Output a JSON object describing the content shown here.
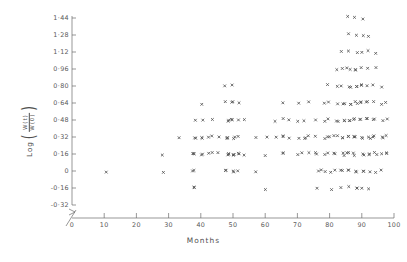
{
  "chart_data": {
    "type": "scatter",
    "title": "",
    "xlabel": "Months",
    "ylabel": "Log (W(t)/W(0))",
    "ylabel_parts": {
      "prefix": "Log",
      "numerator": "W(t)",
      "denominator": "W(0)"
    },
    "xlim": [
      0,
      100
    ],
    "ylim": [
      -0.32,
      1.44
    ],
    "xticks": [
      0,
      10,
      20,
      30,
      40,
      50,
      60,
      70,
      80,
      90,
      100
    ],
    "xtick_labels": [
      "0",
      "10",
      "20",
      "30",
      "40",
      "50",
      "60",
      "70",
      "80",
      "90",
      "100"
    ],
    "yticks": [
      1.44,
      1.28,
      1.12,
      0.96,
      0.8,
      0.64,
      0.48,
      0.32,
      0.16,
      0,
      -0.16,
      -0.32
    ],
    "ytick_labels": [
      "1·44",
      "1·28",
      "1·12",
      "0·96",
      "0·80",
      "0·64",
      "0·48",
      "0·32",
      "0·16",
      "0",
      "-0·16",
      "-0·32"
    ],
    "grid": false,
    "legend": false,
    "marker": "x",
    "marker_color": "#555555",
    "axis_break_x": true,
    "axis_break_y": true,
    "points": [
      [
        10,
        0.0
      ],
      [
        28,
        0.16
      ],
      [
        28,
        0.0
      ],
      [
        33,
        0.32
      ],
      [
        38,
        0.48
      ],
      [
        38,
        0.32
      ],
      [
        38,
        0.32
      ],
      [
        38,
        0.16
      ],
      [
        38,
        0.16
      ],
      [
        38,
        0.16
      ],
      [
        38,
        0.0
      ],
      [
        38,
        0.0
      ],
      [
        38,
        -0.16
      ],
      [
        38,
        -0.16
      ],
      [
        40,
        0.64
      ],
      [
        40,
        0.48
      ],
      [
        40,
        0.32
      ],
      [
        40,
        0.32
      ],
      [
        40,
        0.16
      ],
      [
        40,
        0.16
      ],
      [
        42,
        0.32
      ],
      [
        42,
        0.16
      ],
      [
        44,
        0.48
      ],
      [
        44,
        0.32
      ],
      [
        44,
        0.16
      ],
      [
        46,
        0.32
      ],
      [
        46,
        0.16
      ],
      [
        48,
        0.8
      ],
      [
        48,
        0.64
      ],
      [
        48,
        0.48
      ],
      [
        48,
        0.48
      ],
      [
        48,
        0.32
      ],
      [
        48,
        0.32
      ],
      [
        48,
        0.32
      ],
      [
        48,
        0.16
      ],
      [
        48,
        0.16
      ],
      [
        48,
        0.16
      ],
      [
        48,
        0.0
      ],
      [
        48,
        0.0
      ],
      [
        50,
        0.8
      ],
      [
        50,
        0.64
      ],
      [
        50,
        0.64
      ],
      [
        50,
        0.48
      ],
      [
        50,
        0.48
      ],
      [
        50,
        0.32
      ],
      [
        50,
        0.32
      ],
      [
        50,
        0.16
      ],
      [
        50,
        0.16
      ],
      [
        50,
        0.16
      ],
      [
        50,
        0.0
      ],
      [
        50,
        0.0
      ],
      [
        52,
        0.64
      ],
      [
        52,
        0.48
      ],
      [
        52,
        0.32
      ],
      [
        52,
        0.16
      ],
      [
        52,
        0.16
      ],
      [
        52,
        0.0
      ],
      [
        54,
        0.48
      ],
      [
        54,
        0.16
      ],
      [
        57,
        0.32
      ],
      [
        57,
        0.0
      ],
      [
        60,
        0.32
      ],
      [
        60,
        0.16
      ],
      [
        60,
        -0.16
      ],
      [
        63,
        0.48
      ],
      [
        63,
        0.32
      ],
      [
        66,
        0.64
      ],
      [
        66,
        0.48
      ],
      [
        66,
        0.32
      ],
      [
        66,
        0.32
      ],
      [
        66,
        0.16
      ],
      [
        66,
        0.16
      ],
      [
        68,
        0.48
      ],
      [
        68,
        0.32
      ],
      [
        70,
        0.64
      ],
      [
        70,
        0.48
      ],
      [
        70,
        0.32
      ],
      [
        70,
        0.16
      ],
      [
        72,
        0.48
      ],
      [
        72,
        0.32
      ],
      [
        72,
        0.32
      ],
      [
        72,
        0.16
      ],
      [
        74,
        0.64
      ],
      [
        74,
        0.32
      ],
      [
        74,
        0.16
      ],
      [
        76,
        0.48
      ],
      [
        76,
        0.32
      ],
      [
        76,
        0.16
      ],
      [
        76,
        0.16
      ],
      [
        76,
        0.0
      ],
      [
        76,
        -0.16
      ],
      [
        78,
        0.64
      ],
      [
        78,
        0.48
      ],
      [
        78,
        0.32
      ],
      [
        78,
        0.16
      ],
      [
        78,
        0.0
      ],
      [
        78,
        0.0
      ],
      [
        80,
        0.8
      ],
      [
        80,
        0.64
      ],
      [
        80,
        0.48
      ],
      [
        80,
        0.32
      ],
      [
        80,
        0.32
      ],
      [
        80,
        0.16
      ],
      [
        80,
        0.0
      ],
      [
        80,
        -0.16
      ],
      [
        82,
        0.96
      ],
      [
        82,
        0.8
      ],
      [
        82,
        0.64
      ],
      [
        82,
        0.48
      ],
      [
        82,
        0.48
      ],
      [
        82,
        0.32
      ],
      [
        82,
        0.32
      ],
      [
        82,
        0.16
      ],
      [
        82,
        0.16
      ],
      [
        82,
        0.0
      ],
      [
        84,
        1.12
      ],
      [
        84,
        0.96
      ],
      [
        84,
        0.8
      ],
      [
        84,
        0.64
      ],
      [
        84,
        0.64
      ],
      [
        84,
        0.48
      ],
      [
        84,
        0.48
      ],
      [
        84,
        0.32
      ],
      [
        84,
        0.32
      ],
      [
        84,
        0.16
      ],
      [
        84,
        0.16
      ],
      [
        84,
        0.0
      ],
      [
        84,
        0.0
      ],
      [
        84,
        -0.16
      ],
      [
        86,
        1.44
      ],
      [
        86,
        1.28
      ],
      [
        86,
        1.12
      ],
      [
        86,
        0.96
      ],
      [
        86,
        0.96
      ],
      [
        86,
        0.8
      ],
      [
        86,
        0.8
      ],
      [
        86,
        0.64
      ],
      [
        86,
        0.64
      ],
      [
        86,
        0.48
      ],
      [
        86,
        0.48
      ],
      [
        86,
        0.32
      ],
      [
        86,
        0.32
      ],
      [
        86,
        0.16
      ],
      [
        86,
        0.16
      ],
      [
        86,
        0.0
      ],
      [
        86,
        0.0
      ],
      [
        86,
        -0.16
      ],
      [
        88,
        1.44
      ],
      [
        88,
        1.28
      ],
      [
        88,
        1.12
      ],
      [
        88,
        0.96
      ],
      [
        88,
        0.96
      ],
      [
        88,
        0.8
      ],
      [
        88,
        0.8
      ],
      [
        88,
        0.64
      ],
      [
        88,
        0.64
      ],
      [
        88,
        0.48
      ],
      [
        88,
        0.48
      ],
      [
        88,
        0.32
      ],
      [
        88,
        0.32
      ],
      [
        88,
        0.32
      ],
      [
        88,
        0.16
      ],
      [
        88,
        0.16
      ],
      [
        88,
        0.0
      ],
      [
        88,
        0.0
      ],
      [
        88,
        -0.16
      ],
      [
        88,
        -0.16
      ],
      [
        90,
        1.44
      ],
      [
        90,
        1.28
      ],
      [
        90,
        1.12
      ],
      [
        90,
        0.96
      ],
      [
        90,
        0.8
      ],
      [
        90,
        0.8
      ],
      [
        90,
        0.64
      ],
      [
        90,
        0.64
      ],
      [
        90,
        0.48
      ],
      [
        90,
        0.48
      ],
      [
        90,
        0.32
      ],
      [
        90,
        0.32
      ],
      [
        90,
        0.16
      ],
      [
        90,
        0.16
      ],
      [
        90,
        0.0
      ],
      [
        90,
        0.0
      ],
      [
        90,
        -0.16
      ],
      [
        92,
        1.28
      ],
      [
        92,
        1.12
      ],
      [
        92,
        0.96
      ],
      [
        92,
        0.8
      ],
      [
        92,
        0.64
      ],
      [
        92,
        0.64
      ],
      [
        92,
        0.48
      ],
      [
        92,
        0.48
      ],
      [
        92,
        0.32
      ],
      [
        92,
        0.32
      ],
      [
        92,
        0.16
      ],
      [
        92,
        0.16
      ],
      [
        92,
        0.0
      ],
      [
        92,
        -0.16
      ],
      [
        94,
        1.12
      ],
      [
        94,
        0.96
      ],
      [
        94,
        0.8
      ],
      [
        94,
        0.64
      ],
      [
        94,
        0.48
      ],
      [
        94,
        0.48
      ],
      [
        94,
        0.32
      ],
      [
        94,
        0.32
      ],
      [
        94,
        0.16
      ],
      [
        94,
        0.16
      ],
      [
        94,
        0.0
      ],
      [
        96,
        0.8
      ],
      [
        96,
        0.64
      ],
      [
        96,
        0.48
      ],
      [
        96,
        0.32
      ],
      [
        96,
        0.32
      ],
      [
        96,
        0.16
      ],
      [
        96,
        0.0
      ],
      [
        98,
        0.64
      ],
      [
        98,
        0.48
      ],
      [
        98,
        0.32
      ],
      [
        98,
        0.16
      ],
      [
        98,
        0.16
      ]
    ]
  }
}
